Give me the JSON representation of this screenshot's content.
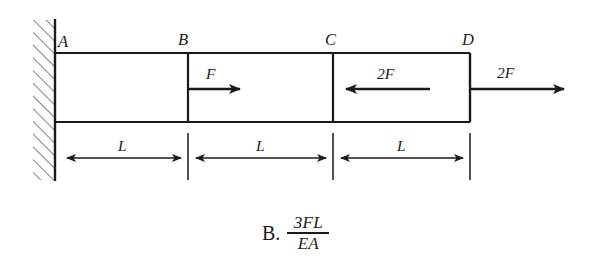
{
  "figure": {
    "type": "statics-axial-bar-diagram",
    "support": {
      "kind": "fixed-wall-hatched",
      "side": "left"
    },
    "nodes": [
      {
        "id": "A",
        "label": "A",
        "x": 55
      },
      {
        "id": "B",
        "label": "B",
        "x": 188
      },
      {
        "id": "C",
        "label": "C",
        "x": 333
      },
      {
        "id": "D",
        "label": "D",
        "x": 470
      }
    ],
    "forces": [
      {
        "label": "F",
        "at_node": "B",
        "direction": "right",
        "magnitude": "F"
      },
      {
        "label": "2F",
        "at_node": "C",
        "direction": "left",
        "magnitude": "2F"
      },
      {
        "label": "2F",
        "at_node": "D",
        "direction": "right",
        "magnitude": "2F"
      }
    ],
    "dimensions": [
      {
        "label": "L",
        "from": "A",
        "to": "B"
      },
      {
        "label": "L",
        "from": "B",
        "to": "C"
      },
      {
        "label": "L",
        "from": "C",
        "to": "D"
      }
    ],
    "colors": {
      "ink": "#1a1a1a",
      "line": "#2b2b2b",
      "hatch": "#5a5a5a",
      "background": "#ffffff"
    }
  },
  "answer": {
    "choice_letter": "B.",
    "numerator": "3FL",
    "denominator": "EA"
  }
}
